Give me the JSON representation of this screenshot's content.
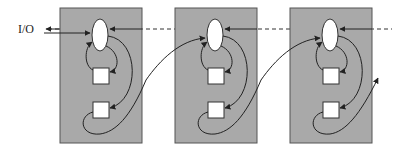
{
  "diagram": {
    "io_label": "I/O",
    "units": [
      {
        "name": "unit-1"
      },
      {
        "name": "unit-2"
      },
      {
        "name": "unit-3"
      }
    ],
    "colors": {
      "box_fill": "#a9a9a9",
      "box_stroke": "#555555",
      "node_fill": "#ffffff",
      "line": "#222222"
    }
  }
}
